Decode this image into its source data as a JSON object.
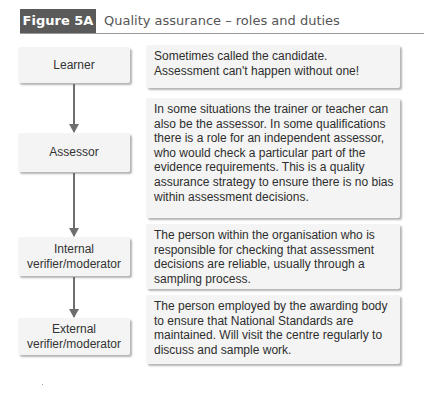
{
  "figure": {
    "label": "Figure 5A",
    "title": "Quality assurance – roles and duties",
    "colors": {
      "label_bg": "#5a5a5a",
      "box_bg": "#f4f4f4",
      "arrow": "#6e6e6e"
    }
  },
  "roles": [
    {
      "name": "Learner",
      "description": "Sometimes called the candidate. Assessment can't happen without one!"
    },
    {
      "name": "Assessor",
      "description": "In some situations the trainer or teacher can also be the assessor. In some qualifications there is a role for an independent assessor, who would check a particular part of the evidence requirements. This is a quality assurance strategy to ensure there is no bias within assessment decisions."
    },
    {
      "name": "Internal verifier/moderator",
      "description": "The person within the organisation who is responsible for checking that assessment decisions are reliable, usually through a sampling process."
    },
    {
      "name": "External verifier/moderator",
      "description": "The person employed by the awarding body to ensure that National Standards are maintained. Will visit the centre regularly to discuss and sample work."
    }
  ]
}
